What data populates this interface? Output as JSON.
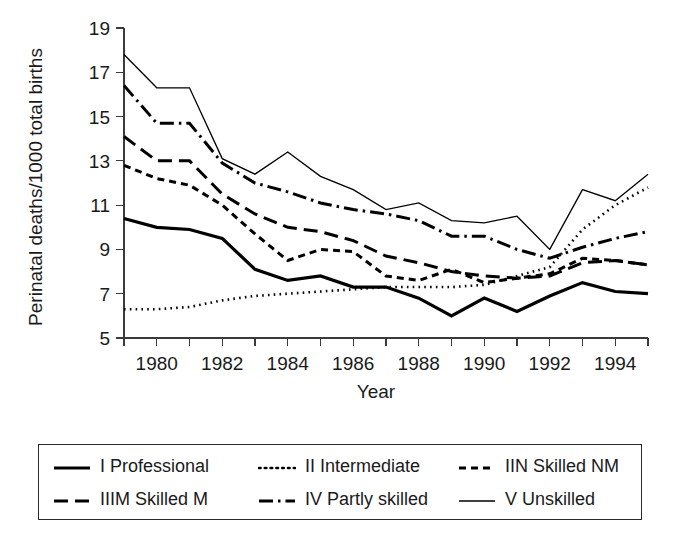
{
  "chart_data": {
    "type": "line",
    "title": "",
    "xlabel": "Year",
    "ylabel": "Perinatal deaths/1000 total births",
    "xlim": [
      1979,
      1995
    ],
    "ylim": [
      5,
      19
    ],
    "yticks": [
      5,
      7,
      9,
      11,
      13,
      15,
      17,
      19
    ],
    "xticks": [
      1980,
      1982,
      1984,
      1986,
      1988,
      1990,
      1992,
      1994
    ],
    "xtick_minor": [
      1979,
      1981,
      1983,
      1985,
      1987,
      1989,
      1991,
      1993,
      1995
    ],
    "grid": false,
    "legend_position": "below-outside",
    "x": [
      1979,
      1980,
      1981,
      1982,
      1983,
      1984,
      1985,
      1986,
      1987,
      1988,
      1989,
      1990,
      1991,
      1992,
      1993,
      1994,
      1995
    ],
    "series": [
      {
        "name": "I Professional",
        "key": "i-professional",
        "style": "solid-thick",
        "dash": "none",
        "width": 3.2,
        "color": "#000000",
        "values": [
          10.4,
          10.0,
          9.9,
          9.5,
          8.1,
          7.6,
          7.8,
          7.3,
          7.3,
          6.8,
          6.0,
          6.8,
          6.2,
          6.9,
          7.5,
          7.1,
          7.0
        ]
      },
      {
        "name": "II Intermediate",
        "key": "ii-intermediate",
        "style": "dotted",
        "dash": "1.6 4.2",
        "width": 2.6,
        "color": "#000000",
        "values": [
          6.3,
          6.3,
          6.4,
          6.7,
          6.9,
          7.0,
          7.1,
          7.2,
          7.3,
          7.3,
          7.3,
          7.4,
          7.8,
          8.2,
          9.9,
          11.0,
          11.8
        ]
      },
      {
        "name": "IIN Skilled NM",
        "key": "iin-skilled-nm",
        "style": "dashed-short",
        "dash": "7 5",
        "width": 3.0,
        "color": "#000000",
        "values": [
          12.8,
          12.2,
          11.9,
          11.0,
          9.7,
          8.5,
          9.0,
          8.9,
          7.8,
          7.6,
          8.1,
          7.5,
          7.7,
          7.9,
          8.6,
          8.5,
          8.3
        ]
      },
      {
        "name": "IIIM Skilled M",
        "key": "iiim-skilled-m",
        "style": "dashed-long",
        "dash": "14 7",
        "width": 3.0,
        "color": "#000000",
        "values": [
          14.1,
          13.0,
          13.0,
          11.5,
          10.6,
          10.0,
          9.8,
          9.4,
          8.7,
          8.4,
          8.0,
          7.8,
          7.7,
          7.8,
          8.4,
          8.5,
          8.3
        ]
      },
      {
        "name": "IV Partly skilled",
        "key": "iv-partly-skilled",
        "style": "dash-dot",
        "dash": "14 5 2.5 5",
        "width": 3.0,
        "color": "#000000",
        "values": [
          16.4,
          14.7,
          14.7,
          12.9,
          12.0,
          11.6,
          11.1,
          10.8,
          10.6,
          10.3,
          9.6,
          9.6,
          9.0,
          8.6,
          9.1,
          9.5,
          9.8
        ]
      },
      {
        "name": "V Unskilled",
        "key": "v-unskilled",
        "style": "solid-thin",
        "dash": "none",
        "width": 1.3,
        "color": "#000000",
        "values": [
          17.8,
          16.3,
          16.3,
          13.1,
          12.4,
          13.4,
          12.3,
          11.7,
          10.8,
          11.1,
          10.3,
          10.2,
          10.5,
          9.0,
          11.7,
          11.2,
          12.4
        ]
      }
    ]
  },
  "legend": {
    "entries": [
      {
        "label": "I Professional",
        "key": "i-professional"
      },
      {
        "label": "II Intermediate",
        "key": "ii-intermediate"
      },
      {
        "label": "IIN Skilled NM",
        "key": "iin-skilled-nm"
      },
      {
        "label": "IIIM Skilled M",
        "key": "iiim-skilled-m"
      },
      {
        "label": "IV Partly skilled",
        "key": "iv-partly-skilled"
      },
      {
        "label": "V Unskilled",
        "key": "v-unskilled"
      }
    ]
  }
}
